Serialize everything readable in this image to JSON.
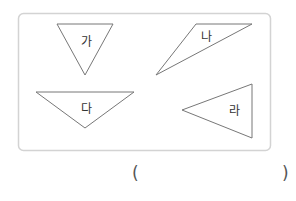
{
  "figure": {
    "box": {
      "x": 18,
      "y": 13,
      "width": 252,
      "height": 137,
      "radius": 5,
      "stroke": "#d3d3d3"
    },
    "triangles": [
      {
        "label": "가",
        "points": "57,24 113,24 85,75",
        "label_x": 86,
        "label_y": 42
      },
      {
        "label": "나",
        "points": "196,24 252,24 156,75",
        "label_x": 206,
        "label_y": 37
      },
      {
        "label": "다",
        "points": "36,92 134,92 85,128",
        "label_x": 86,
        "label_y": 109
      },
      {
        "label": "라",
        "points": "182,110 252,84 252,138",
        "label_x": 234,
        "label_y": 111
      }
    ],
    "stroke_color": "#777777",
    "label_color": "#333333"
  },
  "answer": {
    "open_paren": "(",
    "close_paren": ")"
  }
}
